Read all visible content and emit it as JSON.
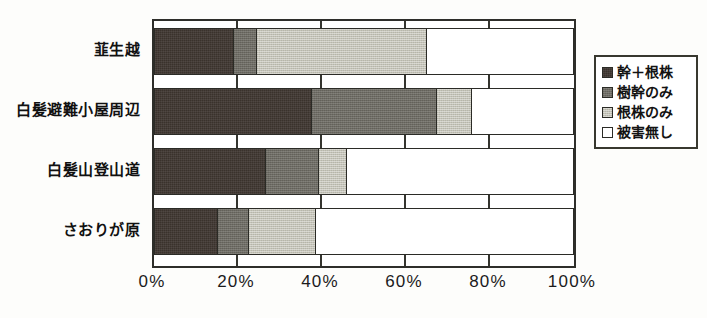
{
  "chart_data": {
    "type": "bar",
    "orientation": "horizontal",
    "stacked": true,
    "normalized": true,
    "title": "",
    "xlabel": "",
    "ylabel": "",
    "xlim": [
      0,
      100
    ],
    "grid": true,
    "legend_position": "right",
    "categories": [
      "韮生越",
      "白髪避難小屋周辺",
      "白髪山登山道",
      "さおりが原"
    ],
    "xtick_labels": [
      "0%",
      "20%",
      "40%",
      "60%",
      "80%",
      "100%"
    ],
    "xtick_values": [
      0,
      20,
      40,
      60,
      80,
      100
    ],
    "series": [
      {
        "name": "幹＋根株",
        "color": "#3a322c",
        "values": [
          19.0,
          37.5,
          26.7,
          15.2
        ]
      },
      {
        "name": "樹幹のみ",
        "color": "#6e6c64",
        "values": [
          5.5,
          29.8,
          12.6,
          7.4
        ]
      },
      {
        "name": "根株のみ",
        "color": "#c3c2b6",
        "values": [
          40.5,
          8.3,
          6.7,
          16.0
        ]
      },
      {
        "name": "被害無し",
        "color": "#ffffff",
        "values": [
          35.0,
          24.4,
          54.0,
          61.4
        ]
      }
    ]
  },
  "caption": ""
}
